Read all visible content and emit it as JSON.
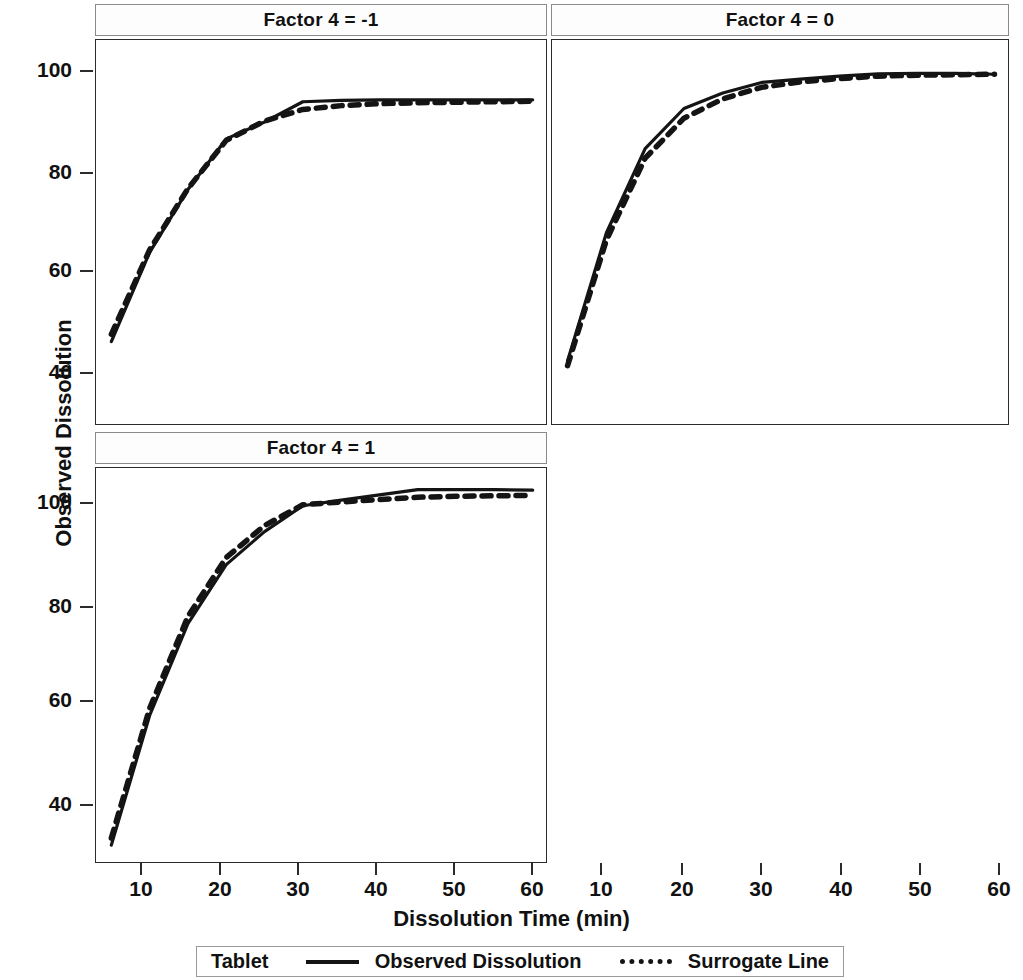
{
  "figure": {
    "xlabel": "Dissolution Time (min)",
    "ylabel": "Observed Dissolution"
  },
  "legend": {
    "group_label": "Tablet",
    "series": [
      {
        "name": "Observed Dissolution",
        "style": "solid"
      },
      {
        "name": "Surrogate Line",
        "style": "dashed"
      }
    ]
  },
  "panels": [
    {
      "id": "p1",
      "title": "Factor 4 = -1"
    },
    {
      "id": "p2",
      "title": "Factor 4 = 0"
    },
    {
      "id": "p3",
      "title": "Factor 4 = 1"
    },
    {
      "id": "p4",
      "title": ""
    }
  ],
  "axes": {
    "x_ticks": [
      10,
      20,
      30,
      40,
      50,
      60
    ],
    "x_tick_labels": [
      "10",
      "20",
      "30",
      "40",
      "50",
      "60"
    ],
    "xlim": [
      3,
      62
    ],
    "y_ticks_top": [
      40,
      60,
      80,
      100
    ],
    "y_tick_labels_top": [
      "40",
      "60",
      "80",
      "100"
    ],
    "ylim_top": [
      28,
      108
    ],
    "y_ticks_bottom": [
      40,
      60,
      80,
      100
    ],
    "y_tick_labels_bottom": [
      "40",
      "60",
      "80",
      "100"
    ],
    "ylim_bottom": [
      26,
      110
    ],
    "grid": false
  },
  "colors": {
    "line": "#141414",
    "frame": "#2b2b2b",
    "header_border": "#8a8a8a",
    "background": "#ffffff"
  },
  "chart_data": {
    "type": "line",
    "title": "",
    "xlabel": "Dissolution Time (min)",
    "ylabel": "Observed Dissolution",
    "grid": false,
    "legend_position": "bottom",
    "panel_layout": [
      2,
      2
    ],
    "panels": [
      {
        "title": "Factor 4 = -1",
        "xlim": [
          3,
          62
        ],
        "ylim": [
          28,
          108
        ],
        "x": [
          5,
          10,
          15,
          20,
          25,
          30,
          35,
          40,
          45,
          50,
          55,
          60
        ],
        "series": [
          {
            "name": "Observed Dissolution",
            "style": "solid",
            "values": [
              45.5,
              64.0,
              77.0,
              87.5,
              91.0,
              95.2,
              95.5,
              95.6,
              95.6,
              95.6,
              95.6,
              95.6
            ]
          },
          {
            "name": "Surrogate Line",
            "style": "dashed",
            "values": [
              47.0,
              64.5,
              77.2,
              87.2,
              91.2,
              93.6,
              94.4,
              94.8,
              95.0,
              95.1,
              95.2,
              95.3
            ]
          }
        ]
      },
      {
        "title": "Factor 4 = 0",
        "xlim": [
          3,
          62
        ],
        "ylim": [
          28,
          108
        ],
        "x": [
          5,
          10,
          15,
          20,
          25,
          30,
          35,
          40,
          45,
          50,
          55,
          60
        ],
        "series": [
          {
            "name": "Observed Dissolution",
            "style": "solid",
            "values": [
              41.5,
              68.0,
              85.5,
              93.8,
              97.0,
              99.2,
              99.9,
              100.5,
              101.0,
              101.1,
              101.1,
              100.9
            ]
          },
          {
            "name": "Surrogate Line",
            "style": "dashed",
            "values": [
              40.5,
              66.5,
              83.5,
              91.8,
              95.8,
              98.2,
              99.3,
              100.0,
              100.5,
              100.7,
              100.8,
              100.9
            ]
          }
        ]
      },
      {
        "title": "Factor 4 = 1",
        "xlim": [
          3,
          62
        ],
        "ylim": [
          26,
          110
        ],
        "x": [
          5,
          10,
          15,
          20,
          25,
          30,
          35,
          40,
          45,
          50,
          55,
          60
        ],
        "series": [
          {
            "name": "Observed Dissolution",
            "style": "solid",
            "values": [
              30.0,
              57.5,
              77.0,
              89.5,
              96.5,
              102.0,
              103.2,
              104.3,
              105.4,
              105.4,
              105.4,
              105.3
            ]
          },
          {
            "name": "Surrogate Line",
            "style": "dashed",
            "values": [
              31.5,
              59.0,
              78.5,
              91.0,
              97.8,
              102.2,
              102.8,
              103.3,
              103.8,
              104.0,
              104.1,
              104.2
            ]
          }
        ]
      }
    ]
  }
}
